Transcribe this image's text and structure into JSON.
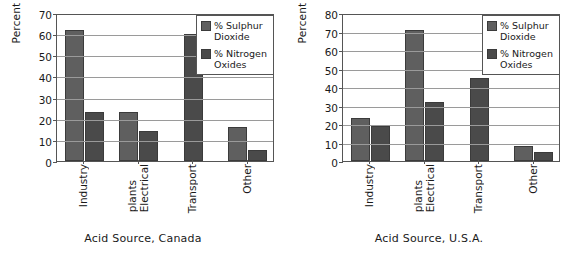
{
  "chart_data": [
    {
      "type": "bar",
      "title": "",
      "xlabel": "Acid Source, Canada",
      "ylabel": "Percent",
      "ylim": [
        0,
        70
      ],
      "ytick_step": 10,
      "yticks": [
        0,
        10,
        20,
        30,
        40,
        50,
        60,
        70
      ],
      "grid": true,
      "legend_position": "top-right",
      "categories": [
        "Industry",
        "Electrical plants",
        "Transport",
        "Other"
      ],
      "category_lines": [
        [
          "Industry"
        ],
        [
          "Electrical",
          "plants"
        ],
        [
          "Transport"
        ],
        [
          "Other"
        ]
      ],
      "series": [
        {
          "name": "% Sulphur Dioxide",
          "color": "#5f5f5f",
          "values": [
            62,
            23,
            null,
            16
          ]
        },
        {
          "name": "% Nitrogen Oxides",
          "color": "#4a4a4a",
          "values": [
            23,
            14,
            60,
            5
          ]
        }
      ]
    },
    {
      "type": "bar",
      "title": "",
      "xlabel": "Acid Source, U.S.A.",
      "ylabel": "Percent",
      "ylim": [
        0,
        80
      ],
      "ytick_step": 10,
      "yticks": [
        0,
        10,
        20,
        30,
        40,
        50,
        60,
        70,
        80
      ],
      "grid": true,
      "legend_position": "top-right",
      "categories": [
        "Industry",
        "Electrical plants",
        "Transport",
        "Other"
      ],
      "category_lines": [
        [
          "Industry"
        ],
        [
          "Electrical",
          "plants"
        ],
        [
          "Transport"
        ],
        [
          "Other"
        ]
      ],
      "series": [
        {
          "name": "% Sulphur Dioxide",
          "color": "#5f5f5f",
          "values": [
            23,
            71,
            null,
            8
          ]
        },
        {
          "name": "% Nitrogen Oxides",
          "color": "#4a4a4a",
          "values": [
            19,
            32,
            45,
            5
          ]
        }
      ]
    }
  ],
  "panels": [
    {
      "ylabel": "Percent",
      "caption": "Acid Source, Canada",
      "legend": [
        {
          "label": "% Sulphur Dioxide",
          "swatch": "sulphur"
        },
        {
          "label": "% Nitrogen Oxides",
          "swatch": "nitrogen"
        }
      ]
    },
    {
      "ylabel": "Percent",
      "caption": "Acid Source, U.S.A.",
      "legend": [
        {
          "label": "% Sulphur Dioxide",
          "swatch": "sulphur"
        },
        {
          "label": "% Nitrogen Oxides",
          "swatch": "nitrogen"
        }
      ]
    }
  ]
}
